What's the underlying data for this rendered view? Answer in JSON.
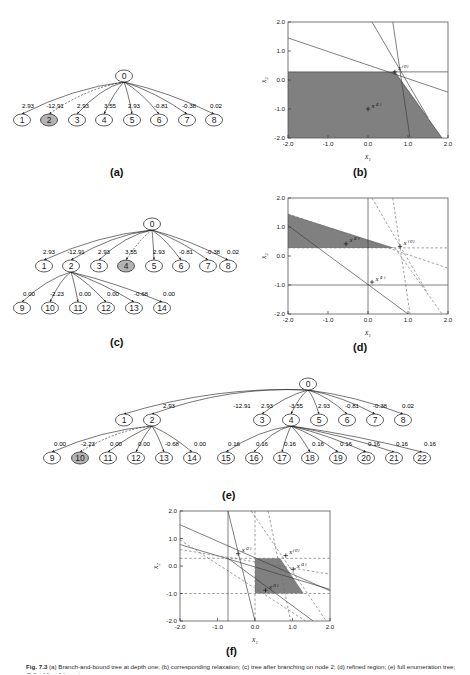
{
  "figure": {
    "caption_prefix": "Fig. 7.3",
    "caption": "(a) Branch-and-bound tree at depth one; (b) corresponding relaxation; (c) tree after branching on node 2; (d) refined region; (e) full enumeration tree; (f) final feasible region.",
    "panel_labels": [
      "(a)",
      "(b)",
      "(c)",
      "(d)",
      "(e)",
      "(f)"
    ],
    "colors": {
      "shade_fill": "#808080",
      "node_highlight": "#b3b3b3",
      "node_fill": "#ffffff",
      "stroke": "#1a1a1a",
      "grey_line": "#8c8c8c"
    }
  },
  "tree_a": {
    "label": "(a)",
    "root": "0",
    "children": [
      "1",
      "2",
      "3",
      "4",
      "5",
      "6",
      "7",
      "8"
    ],
    "edge_labels": [
      "2.93",
      "-12.91",
      "2.93",
      "3.55",
      "2.93",
      "-0.81",
      "-0.38",
      "0.02"
    ],
    "highlighted": [
      "2"
    ]
  },
  "tree_c": {
    "label": "(c)",
    "root": "0",
    "level1": [
      "1",
      "2",
      "3",
      "4",
      "5",
      "6",
      "7",
      "8"
    ],
    "level1_edges": [
      "2.93",
      "-12.91",
      "2.93",
      "3.55",
      "2.93",
      "-0.81",
      "-0.38",
      "0.02"
    ],
    "level2_parent": "2",
    "level2": [
      "9",
      "10",
      "11",
      "12",
      "13",
      "14"
    ],
    "level2_edges": [
      "0.00",
      "-2.23",
      "0.00",
      "0.00",
      "-0.68",
      "0.00"
    ],
    "highlighted": [
      "4"
    ]
  },
  "tree_e": {
    "label": "(e)",
    "root": "0",
    "level1": [
      "1",
      "2",
      "3",
      "4",
      "5",
      "6",
      "7",
      "8"
    ],
    "level1_edges": [
      "2.93",
      "-12.91",
      "2.93",
      "-3.55",
      "2.93",
      "-0.81",
      "-0.38",
      "0.02"
    ],
    "branch_left_parent": "2",
    "branch_left": [
      "9",
      "10",
      "11",
      "12",
      "13",
      "14"
    ],
    "branch_left_edges": [
      "0.00",
      "-2.23",
      "0.00",
      "0.00",
      "-0.68",
      "0.00"
    ],
    "branch_right_parent": "4",
    "branch_right": [
      "15",
      "16",
      "17",
      "18",
      "19",
      "20",
      "21",
      "22"
    ],
    "branch_right_edges": [
      "0.16",
      "0.16",
      "0.16",
      "0.16",
      "0.16",
      "0.16",
      "0.16",
      "0.16"
    ],
    "highlighted": [
      "10"
    ]
  },
  "chart_data": [
    {
      "id": "b",
      "type": "area",
      "title": "(b)",
      "xlabel": "x₁",
      "ylabel": "x₂",
      "xlim": [
        -2.0,
        2.0
      ],
      "ylim": [
        -2.0,
        2.0
      ],
      "xticks": [
        "-2.0",
        "-1.0",
        "0.0",
        "1.0",
        "2.0"
      ],
      "yticks": [
        "-2.0",
        "-1.0",
        "0.0",
        "1.0",
        "2.0"
      ],
      "grid": false,
      "annotations": [
        {
          "text": "x⁽⁰⁾",
          "x": 0.67,
          "y": 0.28
        },
        {
          "text": "x⁽¹⁾",
          "x": 0.0,
          "y": -1.0
        }
      ],
      "region_vertices": [
        [
          -2.0,
          0.28
        ],
        [
          0.67,
          0.28
        ],
        [
          1.85,
          -2.0
        ],
        [
          -2.0,
          -2.0
        ]
      ],
      "lines": [
        {
          "p1": [
            -2.0,
            1.45
          ],
          "p2": [
            2.0,
            -0.42
          ],
          "style": "solid"
        },
        {
          "p1": [
            0.1,
            2.0
          ],
          "p2": [
            1.5,
            -1.3
          ],
          "style": "solid"
        },
        {
          "p1": [
            0.62,
            2.0
          ],
          "p2": [
            1.05,
            -2.0
          ],
          "style": "solid"
        },
        {
          "p1": [
            -2.0,
            0.28
          ],
          "p2": [
            2.0,
            0.28
          ],
          "style": "solid"
        },
        {
          "p1": [
            0.67,
            0.28
          ],
          "p2": [
            1.85,
            -2.0
          ],
          "style": "solid"
        }
      ]
    },
    {
      "id": "d",
      "type": "area",
      "title": "(d)",
      "xlabel": "x₁",
      "ylabel": "x₂",
      "xlim": [
        -2.0,
        2.0
      ],
      "ylim": [
        -2.0,
        2.0
      ],
      "xticks": [
        "-2.0",
        "-1.0",
        "0.0",
        "1.0",
        "2.0"
      ],
      "yticks": [
        "-2.0",
        "-1.0",
        "0.0",
        "1.0",
        "2.0"
      ],
      "grid": false,
      "annotations": [
        {
          "text": "x⁽⁰⁾",
          "x": 0.8,
          "y": 0.33
        },
        {
          "text": "x⁽¹⁾",
          "x": 0.1,
          "y": -0.9
        },
        {
          "text": "x⁽²⁾",
          "x": -0.55,
          "y": 0.42
        }
      ],
      "region_vertices": [
        [
          -2.0,
          1.45
        ],
        [
          0.67,
          0.28
        ],
        [
          -2.0,
          0.28
        ]
      ],
      "lines": [
        {
          "p1": [
            -2.0,
            1.45
          ],
          "p2": [
            2.0,
            -0.42
          ],
          "style": "dashed"
        },
        {
          "p1": [
            0.1,
            2.0
          ],
          "p2": [
            1.5,
            -1.3
          ],
          "style": "dashed"
        },
        {
          "p1": [
            0.62,
            2.0
          ],
          "p2": [
            1.05,
            -2.0
          ],
          "style": "dashed"
        },
        {
          "p1": [
            -2.0,
            0.28
          ],
          "p2": [
            2.0,
            0.28
          ],
          "style": "dashed"
        },
        {
          "p1": [
            0.67,
            0.28
          ],
          "p2": [
            1.85,
            -2.0
          ],
          "style": "dashed"
        },
        {
          "p1": [
            -2.0,
            1.05
          ],
          "p2": [
            1.0,
            -2.0
          ],
          "style": "solid"
        },
        {
          "p1": [
            -2.0,
            -1.0
          ],
          "p2": [
            2.0,
            -1.0
          ],
          "style": "solid"
        },
        {
          "p1": [
            0.0,
            2.0
          ],
          "p2": [
            0.0,
            -2.0
          ],
          "style": "solid"
        }
      ]
    },
    {
      "id": "f",
      "type": "area",
      "title": "(f)",
      "xlabel": "x₁",
      "ylabel": "x₂",
      "xlim": [
        -2.0,
        2.0
      ],
      "ylim": [
        -2.0,
        2.0
      ],
      "xticks": [
        "-2.0",
        "-1.0",
        "0.0",
        "1.0",
        "2.0"
      ],
      "yticks": [
        "-2.0",
        "-1.0",
        "0.0",
        "1.0",
        "2.0"
      ],
      "grid": false,
      "annotations": [
        {
          "text": "x⁽⁰⁾",
          "x": 0.82,
          "y": 0.38
        },
        {
          "text": "x⁽¹⁾",
          "x": 0.28,
          "y": -0.88
        },
        {
          "text": "x⁽²⁾",
          "x": -0.45,
          "y": 0.45
        },
        {
          "text": "x⁽³⁾",
          "x": 1.02,
          "y": -0.12
        }
      ],
      "region_vertices": [
        [
          0.0,
          0.28
        ],
        [
          0.67,
          0.28
        ],
        [
          1.3,
          -1.0
        ],
        [
          0.0,
          -1.0
        ]
      ],
      "lines": [
        {
          "p1": [
            -2.0,
            1.5
          ],
          "p2": [
            2.0,
            -0.9
          ],
          "style": "solid"
        },
        {
          "p1": [
            -2.0,
            0.78
          ],
          "p2": [
            2.0,
            -0.85
          ],
          "style": "solid"
        },
        {
          "p1": [
            -0.72,
            2.0
          ],
          "p2": [
            0.0,
            -2.0
          ],
          "style": "solid"
        },
        {
          "p1": [
            -0.72,
            0.28
          ],
          "p2": [
            1.55,
            -2.0
          ],
          "style": "solid"
        },
        {
          "p1": [
            -2.0,
            0.95
          ],
          "p2": [
            1.35,
            -2.0
          ],
          "style": "dashed"
        },
        {
          "p1": [
            -0.1,
            2.0
          ],
          "p2": [
            1.9,
            -2.0
          ],
          "style": "dashed"
        },
        {
          "p1": [
            0.35,
            2.0
          ],
          "p2": [
            0.95,
            -2.0
          ],
          "style": "dashed"
        },
        {
          "p1": [
            -2.0,
            0.6
          ],
          "p2": [
            2.0,
            -0.3
          ],
          "style": "dashed"
        },
        {
          "p1": [
            0.0,
            2.0
          ],
          "p2": [
            0.0,
            -2.0
          ],
          "style": "dashed"
        },
        {
          "p1": [
            -2.0,
            0.28
          ],
          "p2": [
            2.0,
            0.28
          ],
          "style": "dashed"
        },
        {
          "p1": [
            -2.0,
            -1.0
          ],
          "p2": [
            2.0,
            -1.0
          ],
          "style": "dashed"
        },
        {
          "p1": [
            -0.72,
            2.0
          ],
          "p2": [
            -0.72,
            -2.0
          ],
          "style": "solid"
        }
      ]
    }
  ]
}
